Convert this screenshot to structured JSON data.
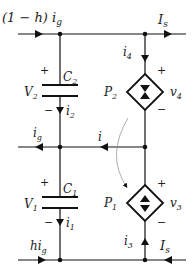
{
  "diagram": {
    "type": "circuit",
    "labels": {
      "top_left_current": "(1 − h) i",
      "top_left_current_sub": "g",
      "top_right_current": "I",
      "top_right_current_sub": "s",
      "i4": "i",
      "i4_sub": "4",
      "c2": "C",
      "c2_sub": "2",
      "v2": "V",
      "v2_sub": "2",
      "i2": "i",
      "i2_sub": "2",
      "p2": "P",
      "p2_sub": "2",
      "v4": "v",
      "v4_sub": "4",
      "mid_left_current": "i",
      "mid_left_current_sub": "g",
      "mid_current": "i",
      "c1": "C",
      "c1_sub": "1",
      "v1": "V",
      "v1_sub": "1",
      "i1": "i",
      "i1_sub": "1",
      "p1": "P",
      "p1_sub": "1",
      "v3": "v",
      "v3_sub": "3",
      "i3": "i",
      "i3_sub": "3",
      "bottom_left_current": "hi",
      "bottom_left_current_sub": "g",
      "bottom_right_current": "I",
      "bottom_right_current_sub": "s",
      "plus": "+",
      "minus": "−"
    }
  }
}
